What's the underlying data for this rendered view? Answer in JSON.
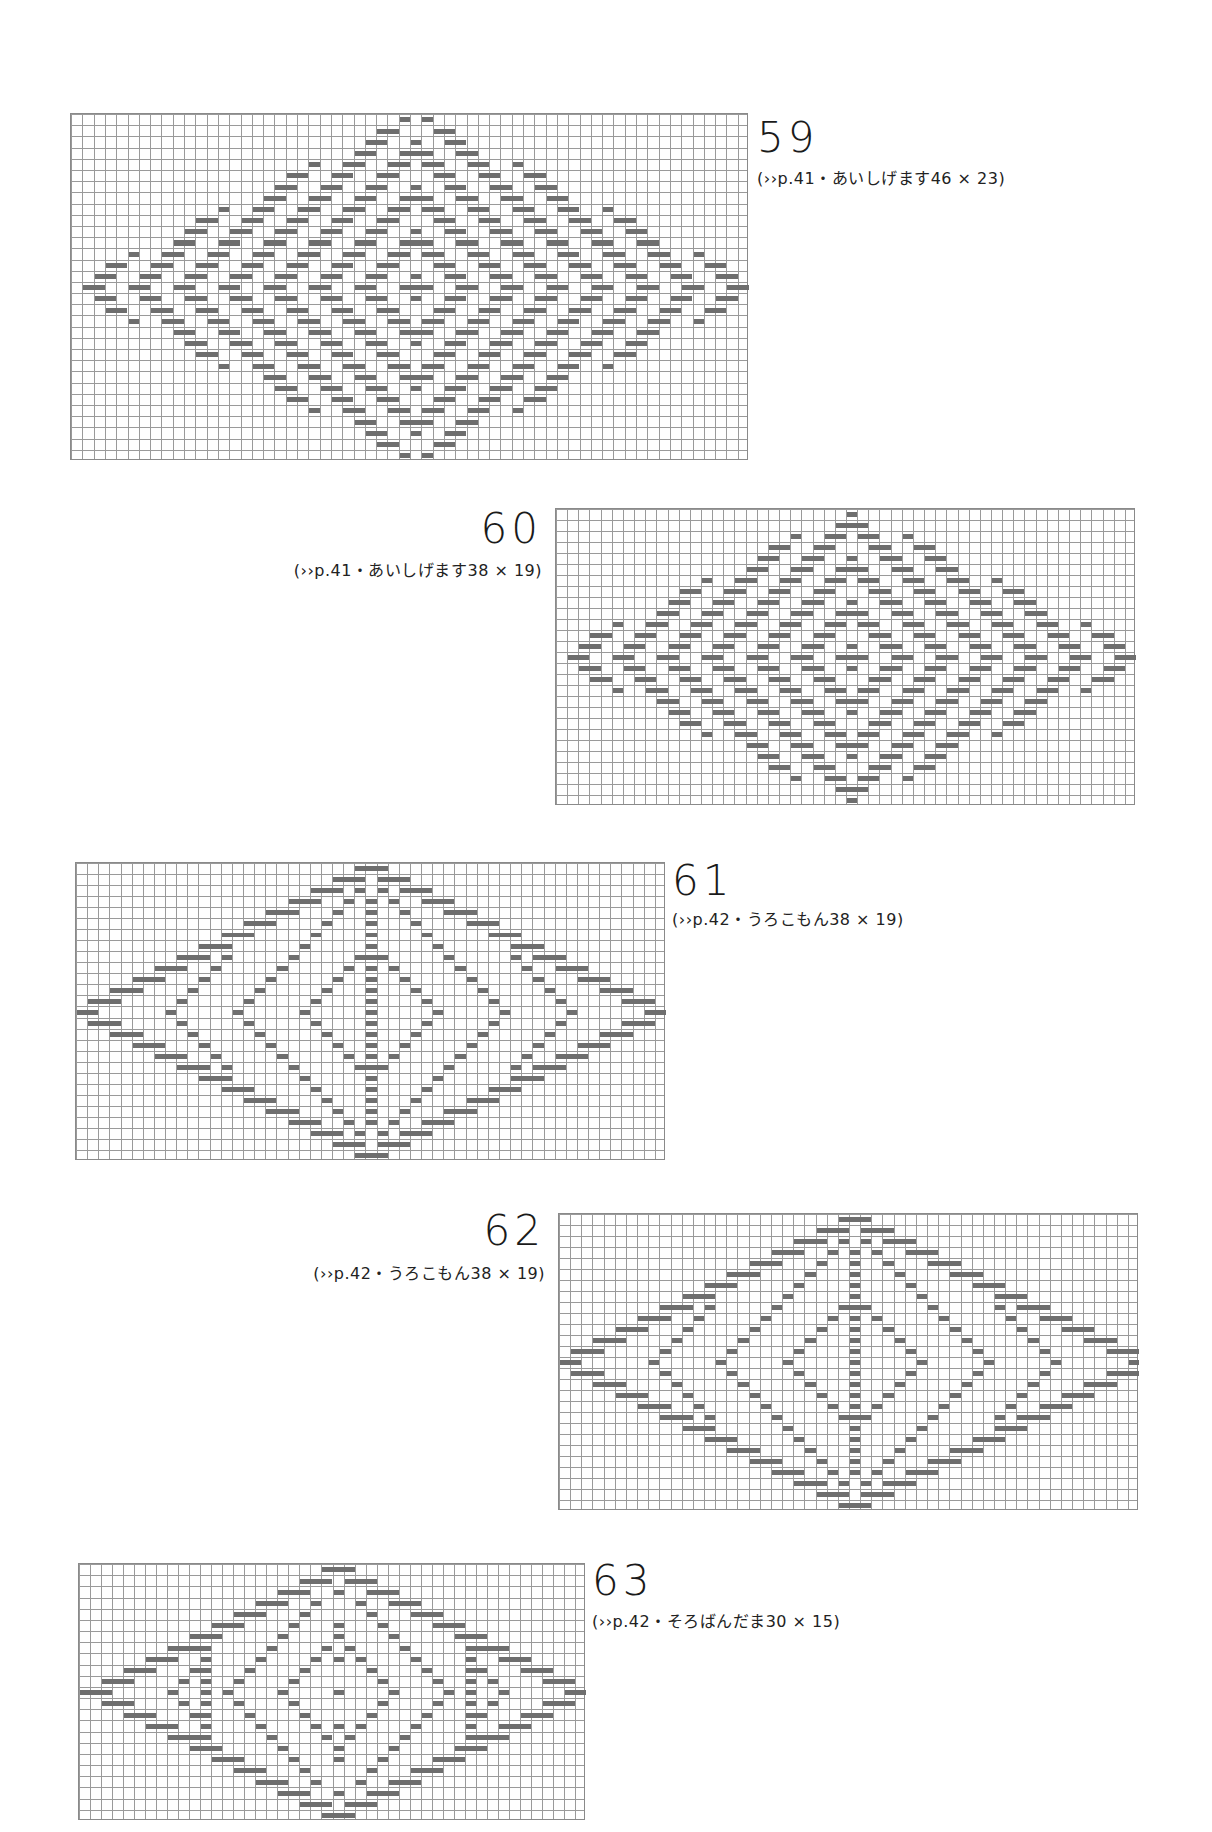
{
  "charts": [
    {
      "id": "59",
      "number": "59",
      "caption": "(››p.41・あいしげます46 × 23)",
      "box": {
        "x": 70,
        "y": 113,
        "w": 678,
        "h": 347
      },
      "cols": 60,
      "rows": 31,
      "pattern": "ring",
      "label": {
        "x": 757,
        "y": 117,
        "cx": 757,
        "cy": 165,
        "align": "left"
      }
    },
    {
      "id": "60",
      "number": "60",
      "caption": "(››p.41・あいしげます38 × 19)",
      "box": {
        "x": 555,
        "y": 508,
        "w": 580,
        "h": 297
      },
      "cols": 52,
      "rows": 27,
      "pattern": "ring",
      "label": {
        "x": 542,
        "y": 508,
        "cx": 542,
        "cy": 557,
        "align": "right"
      }
    },
    {
      "id": "61",
      "number": "61",
      "caption": "(››p.42・うろこもん38 × 19)",
      "box": {
        "x": 75,
        "y": 862,
        "w": 590,
        "h": 298
      },
      "cols": 53,
      "rows": 27,
      "pattern": "scale",
      "label": {
        "x": 672,
        "y": 860,
        "cx": 672,
        "cy": 906,
        "align": "left"
      }
    },
    {
      "id": "62",
      "number": "62",
      "caption": "(››p.42・うろこもん38 × 19)",
      "box": {
        "x": 558,
        "y": 1213,
        "w": 580,
        "h": 297
      },
      "cols": 52,
      "rows": 27,
      "pattern": "scale",
      "label": {
        "x": 545,
        "y": 1210,
        "cx": 545,
        "cy": 1260,
        "align": "right"
      }
    },
    {
      "id": "63",
      "number": "63",
      "caption": "(››p.42・そろばんだま30 × 15)",
      "box": {
        "x": 78,
        "y": 1563,
        "w": 507,
        "h": 257
      },
      "cols": 46,
      "rows": 23,
      "pattern": "abacus",
      "label": {
        "x": 592,
        "y": 1560,
        "cx": 592,
        "cy": 1608,
        "align": "left"
      }
    }
  ],
  "colors": {
    "grid": "#9a9a9a",
    "stitch": "#6e6e6e",
    "text": "#222222"
  }
}
